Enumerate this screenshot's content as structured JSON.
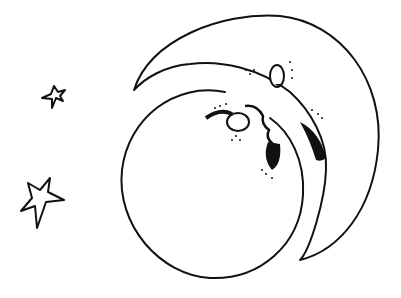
{
  "illustration": {
    "subject": "Crescent moon with face beside full moon and two stars",
    "style": "black ink line art on white",
    "colors": {
      "ink": "#111111",
      "paper": "#ffffff"
    },
    "elements": [
      {
        "name": "crescent-moon",
        "description": "crescent moon with profile face (eyes, nose, open mouth)"
      },
      {
        "name": "full-moon",
        "description": "large circle overlapping crescent"
      },
      {
        "name": "small-star",
        "description": "small five-pointed star upper left"
      },
      {
        "name": "large-star",
        "description": "larger five-pointed star lower left"
      }
    ]
  }
}
